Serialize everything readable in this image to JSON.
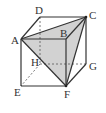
{
  "diagram": {
    "vertices": [
      {
        "name": "A",
        "label": "A"
      },
      {
        "name": "B",
        "label": "B"
      },
      {
        "name": "C",
        "label": "C"
      },
      {
        "name": "D",
        "label": "D"
      },
      {
        "name": "E",
        "label": "E"
      },
      {
        "name": "F",
        "label": "F"
      },
      {
        "name": "G",
        "label": "G"
      },
      {
        "name": "H",
        "label": "H"
      }
    ],
    "visible_edges": [
      "A-B",
      "B-C",
      "C-D",
      "D-A",
      "A-E",
      "E-F",
      "F-G",
      "G-C",
      "B-F"
    ],
    "hidden_edges": [
      "D-H",
      "H-E",
      "H-G"
    ],
    "shaded_triangle": [
      "A",
      "C",
      "F"
    ],
    "colors": {
      "line": "#333333",
      "shade": "#cfcfcf",
      "background": "#ffffff"
    }
  }
}
